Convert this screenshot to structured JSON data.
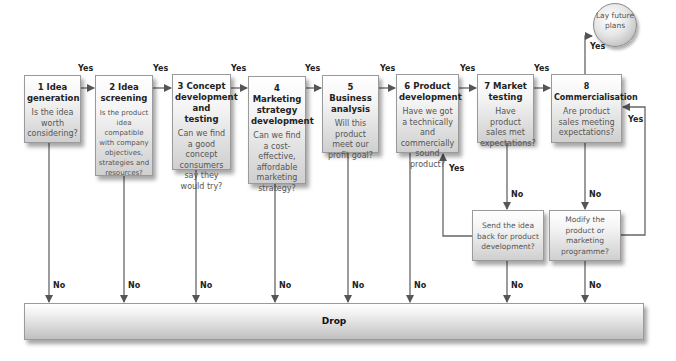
{
  "diagram": {
    "type": "flowchart"
  },
  "stages": [
    {
      "title": "1  Idea generation",
      "question": "Is the idea worth considering?"
    },
    {
      "title": "2  Idea screening",
      "question": "Is the product idea compatible with company objectives, strategies and resources?"
    },
    {
      "title": "3  Concept development and testing",
      "question": "Can we find a good concept consumers say they would try?"
    },
    {
      "title": "4  Marketing strategy development",
      "question": "Can we find a cost-effective, affordable marketing strategy?"
    },
    {
      "title": "5  Business analysis",
      "question": "Will this product meet our profit goal?"
    },
    {
      "title": "6  Product development",
      "question": "Have we got a technically and commercially sound product?"
    },
    {
      "title": "7  Market testing",
      "question": "Have product sales met expectations?"
    },
    {
      "title": "8  Commercialisation",
      "question": "Are product sales meeting expectations?"
    }
  ],
  "side_boxes": {
    "send_back": "Send the idea back for product development?",
    "modify": "Modify the product or marketing programme?"
  },
  "end_nodes": {
    "lay_plans": "Lay future plans",
    "drop": "Drop"
  },
  "labels": {
    "yes": "Yes",
    "no": "No"
  }
}
